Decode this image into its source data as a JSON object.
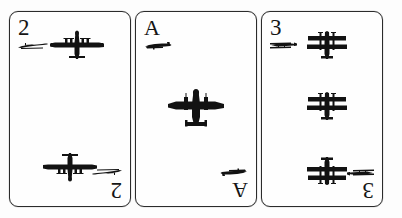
{
  "scene": {
    "background_color": "#ffffff",
    "card_face_color": "#fefefe",
    "ink_color": "#121212",
    "border_color": "#2b2b2b",
    "card_count": 3,
    "description": "Three aircraft-themed playing cards laid side by side"
  },
  "cards": [
    {
      "id": "card-two",
      "rank": "2",
      "rank_alt": "2",
      "suit_name": "four-engine-bomber",
      "pip_count": 2,
      "corner_pip_icon": "bomber-side-icon",
      "main_pip_icon": "four-engine-bomber-top-icon",
      "pips": [
        {
          "position": "top",
          "flipped": false
        },
        {
          "position": "bottom",
          "flipped": true
        }
      ]
    },
    {
      "id": "card-ace",
      "rank": "A",
      "rank_alt": "A",
      "suit_name": "twin-engine-bomber",
      "pip_count": 1,
      "corner_pip_icon": "fighter-side-icon",
      "main_pip_icon": "twin-engine-bomber-top-icon",
      "pips": [
        {
          "position": "middle",
          "flipped": false
        }
      ]
    },
    {
      "id": "card-three",
      "rank": "3",
      "rank_alt": "3",
      "suit_name": "biplane",
      "pip_count": 3,
      "corner_pip_icon": "biplane-side-icon",
      "main_pip_icon": "biplane-top-icon",
      "pips": [
        {
          "position": "top",
          "flipped": false
        },
        {
          "position": "middle",
          "flipped": false
        },
        {
          "position": "bottom",
          "flipped": true
        }
      ]
    }
  ]
}
